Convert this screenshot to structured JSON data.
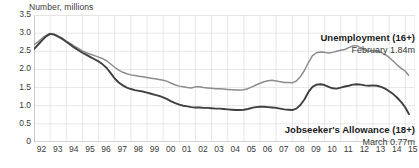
{
  "chart_data": {
    "type": "line",
    "title": "",
    "ylabel": "Number, millions",
    "xlabel": "",
    "ylim": [
      0,
      3.5
    ],
    "yticks": [
      0,
      0.5,
      1.0,
      1.5,
      2.0,
      2.5,
      3.0,
      3.5
    ],
    "ytick_labels": [
      "0",
      "0.5",
      "1.0",
      "1.5",
      "2.0",
      "2.5",
      "3.0",
      "3.5"
    ],
    "categories": [
      "92",
      "93",
      "94",
      "95",
      "96",
      "97",
      "98",
      "99",
      "00",
      "01",
      "02",
      "03",
      "04",
      "05",
      "06",
      "07",
      "08",
      "09",
      "10",
      "11",
      "12",
      "13",
      "14",
      "15"
    ],
    "xlim": [
      1992,
      2015.6
    ],
    "grid": true,
    "legend_position": "inline-annotation",
    "series": [
      {
        "name": "Unemployment (16+)",
        "color": "#8c8c8c",
        "annotation_title": "Unemployment (16+)",
        "annotation_value": "February 1.84m",
        "x": [
          1992.0,
          1992.25,
          1992.5,
          1992.75,
          1993.0,
          1993.25,
          1993.5,
          1993.75,
          1994.0,
          1994.25,
          1994.5,
          1994.75,
          1995.0,
          1995.25,
          1995.5,
          1995.75,
          1996.0,
          1996.25,
          1996.5,
          1996.75,
          1997.0,
          1997.25,
          1997.5,
          1997.75,
          1998.0,
          1998.25,
          1998.5,
          1998.75,
          1999.0,
          1999.25,
          1999.5,
          1999.75,
          2000.0,
          2000.25,
          2000.5,
          2000.75,
          2001.0,
          2001.25,
          2001.5,
          2001.75,
          2002.0,
          2002.25,
          2002.5,
          2002.75,
          2003.0,
          2003.25,
          2003.5,
          2003.75,
          2004.0,
          2004.25,
          2004.5,
          2004.75,
          2005.0,
          2005.25,
          2005.5,
          2005.75,
          2006.0,
          2006.25,
          2006.5,
          2006.75,
          2007.0,
          2007.25,
          2007.5,
          2007.75,
          2008.0,
          2008.25,
          2008.5,
          2008.75,
          2009.0,
          2009.25,
          2009.5,
          2009.75,
          2010.0,
          2010.25,
          2010.5,
          2010.75,
          2011.0,
          2011.25,
          2011.5,
          2011.75,
          2012.0,
          2012.25,
          2012.5,
          2012.75,
          2013.0,
          2013.25,
          2013.5,
          2013.75,
          2014.0,
          2014.25,
          2014.5,
          2014.75,
          2015.0,
          2015.2
        ],
        "values": [
          2.68,
          2.76,
          2.86,
          2.94,
          2.99,
          2.97,
          2.92,
          2.86,
          2.78,
          2.72,
          2.64,
          2.58,
          2.51,
          2.46,
          2.42,
          2.38,
          2.34,
          2.3,
          2.24,
          2.15,
          2.06,
          1.98,
          1.92,
          1.88,
          1.85,
          1.83,
          1.81,
          1.8,
          1.78,
          1.76,
          1.74,
          1.72,
          1.7,
          1.67,
          1.62,
          1.57,
          1.54,
          1.52,
          1.5,
          1.49,
          1.52,
          1.52,
          1.5,
          1.49,
          1.48,
          1.47,
          1.47,
          1.46,
          1.45,
          1.44,
          1.43,
          1.43,
          1.44,
          1.47,
          1.52,
          1.57,
          1.62,
          1.66,
          1.69,
          1.7,
          1.68,
          1.66,
          1.64,
          1.64,
          1.63,
          1.68,
          1.8,
          1.97,
          2.19,
          2.38,
          2.46,
          2.48,
          2.47,
          2.45,
          2.47,
          2.5,
          2.53,
          2.55,
          2.6,
          2.65,
          2.65,
          2.6,
          2.53,
          2.5,
          2.52,
          2.51,
          2.47,
          2.41,
          2.33,
          2.23,
          2.12,
          2.03,
          1.95,
          1.84
        ]
      },
      {
        "name": "Jobseeker's Allowance (18+)",
        "color": "#404040",
        "annotation_title": "Jobseeker's Allowance (18+)",
        "annotation_value": "March 0.77m",
        "x": [
          1992.0,
          1992.25,
          1992.5,
          1992.75,
          1993.0,
          1993.25,
          1993.5,
          1993.75,
          1994.0,
          1994.25,
          1994.5,
          1994.75,
          1995.0,
          1995.25,
          1995.5,
          1995.75,
          1996.0,
          1996.25,
          1996.5,
          1996.75,
          1997.0,
          1997.25,
          1997.5,
          1997.75,
          1998.0,
          1998.25,
          1998.5,
          1998.75,
          1999.0,
          1999.25,
          1999.5,
          1999.75,
          2000.0,
          2000.25,
          2000.5,
          2000.75,
          2001.0,
          2001.25,
          2001.5,
          2001.75,
          2002.0,
          2002.25,
          2002.5,
          2002.75,
          2003.0,
          2003.25,
          2003.5,
          2003.75,
          2004.0,
          2004.25,
          2004.5,
          2004.75,
          2005.0,
          2005.25,
          2005.5,
          2005.75,
          2006.0,
          2006.25,
          2006.5,
          2006.75,
          2007.0,
          2007.25,
          2007.5,
          2007.75,
          2008.0,
          2008.25,
          2008.5,
          2008.75,
          2009.0,
          2009.25,
          2009.5,
          2009.75,
          2010.0,
          2010.25,
          2010.5,
          2010.75,
          2011.0,
          2011.25,
          2011.5,
          2011.75,
          2012.0,
          2012.25,
          2012.5,
          2012.75,
          2013.0,
          2013.25,
          2013.5,
          2013.75,
          2014.0,
          2014.25,
          2014.5,
          2014.75,
          2015.0,
          2015.22
        ],
        "values": [
          2.56,
          2.68,
          2.8,
          2.91,
          2.98,
          2.96,
          2.9,
          2.84,
          2.76,
          2.68,
          2.6,
          2.53,
          2.46,
          2.4,
          2.34,
          2.28,
          2.22,
          2.14,
          2.04,
          1.9,
          1.75,
          1.64,
          1.56,
          1.5,
          1.46,
          1.43,
          1.41,
          1.39,
          1.36,
          1.33,
          1.3,
          1.27,
          1.23,
          1.18,
          1.12,
          1.07,
          1.03,
          1.0,
          0.98,
          0.96,
          0.95,
          0.95,
          0.94,
          0.94,
          0.93,
          0.92,
          0.92,
          0.91,
          0.9,
          0.89,
          0.88,
          0.88,
          0.89,
          0.91,
          0.94,
          0.96,
          0.97,
          0.97,
          0.96,
          0.95,
          0.94,
          0.92,
          0.9,
          0.89,
          0.88,
          0.92,
          1.02,
          1.17,
          1.38,
          1.52,
          1.58,
          1.59,
          1.57,
          1.52,
          1.48,
          1.47,
          1.5,
          1.53,
          1.55,
          1.58,
          1.59,
          1.58,
          1.56,
          1.55,
          1.56,
          1.55,
          1.52,
          1.47,
          1.4,
          1.32,
          1.22,
          1.1,
          0.95,
          0.77
        ]
      }
    ]
  }
}
